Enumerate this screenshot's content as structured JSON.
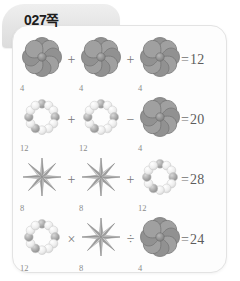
{
  "page": {
    "tab_label": "027쪽",
    "background_color": "#ffffff",
    "card_color": "#fdfdfd",
    "tab_color": "#e6e6e6",
    "text_color": "#5d5d5d",
    "count_label_color": "#8b8b8b"
  },
  "legend": {
    "flower_value": "4",
    "ring_value": "12",
    "star_value": "8"
  },
  "icons": {
    "flower": "flower-icon",
    "ring": "beaded-ring-icon",
    "star": "eight-point-star-icon"
  },
  "equations": [
    {
      "id": "equation-1",
      "terms": [
        {
          "shape": "flower",
          "count": "4"
        },
        {
          "shape": "flower",
          "count": "4"
        },
        {
          "shape": "flower",
          "count": "4"
        }
      ],
      "operators": [
        "+",
        "+"
      ],
      "equals": "=",
      "result": "12"
    },
    {
      "id": "equation-2",
      "terms": [
        {
          "shape": "ring",
          "count": "12"
        },
        {
          "shape": "ring",
          "count": "12"
        },
        {
          "shape": "flower",
          "count": "4"
        }
      ],
      "operators": [
        "+",
        "−"
      ],
      "equals": "=",
      "result": "20"
    },
    {
      "id": "equation-3",
      "terms": [
        {
          "shape": "star",
          "count": "8"
        },
        {
          "shape": "star",
          "count": "8"
        },
        {
          "shape": "ring",
          "count": "12"
        }
      ],
      "operators": [
        "+",
        "+"
      ],
      "equals": "=",
      "result": "28"
    },
    {
      "id": "equation-4",
      "terms": [
        {
          "shape": "ring",
          "count": "12"
        },
        {
          "shape": "star",
          "count": "8"
        },
        {
          "shape": "flower",
          "count": "4"
        }
      ],
      "operators": [
        "×",
        "÷"
      ],
      "equals": "=",
      "result": "24"
    }
  ]
}
